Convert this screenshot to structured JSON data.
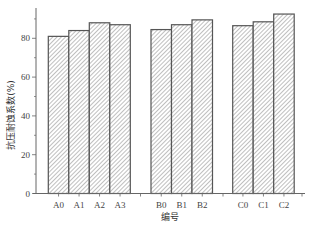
{
  "chart_data": {
    "type": "bar",
    "title": "",
    "xlabel": "编号",
    "ylabel": "抗压耐蚀系数(%)",
    "ylim": [
      0,
      95
    ],
    "yticks": [
      0,
      20,
      40,
      60,
      80
    ],
    "grid": false,
    "legend": null,
    "groups": [
      {
        "name": "A",
        "categories": [
          "A0",
          "A1",
          "A2",
          "A3"
        ],
        "values": [
          81,
          84,
          88,
          87
        ]
      },
      {
        "name": "B",
        "categories": [
          "B0",
          "B1",
          "B2"
        ],
        "values": [
          84.5,
          87,
          89.5
        ]
      },
      {
        "name": "C",
        "categories": [
          "C0",
          "C1",
          "C2"
        ],
        "values": [
          86.5,
          88.5,
          92.5
        ]
      }
    ],
    "categories": [
      "A0",
      "A1",
      "A2",
      "A3",
      "B0",
      "B1",
      "B2",
      "C0",
      "C1",
      "C2"
    ],
    "values": [
      81,
      84,
      88,
      87,
      84.5,
      87,
      89.5,
      86.5,
      88.5,
      92.5
    ],
    "bar_fill": "diagonal-hatch",
    "colors": {
      "bar_edge": "#555555",
      "hatch": "#8a8a8a",
      "axis": "#666666"
    }
  }
}
